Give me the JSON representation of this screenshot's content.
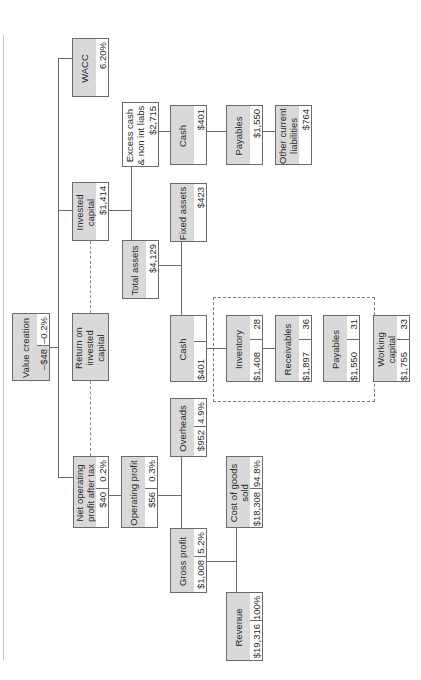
{
  "diagram": {
    "type": "value driver tree",
    "orientation": "rotated 90 degrees counter-clockwise",
    "colors": {
      "box_fill": "#d9d9d9",
      "box_border": "#6b6b6b",
      "line": "#6a6a6a",
      "value_cell": "#ffffff"
    },
    "nodes": {
      "value_creation": {
        "label": "Value creation",
        "value": "–$48",
        "pct": "–0.2%"
      },
      "wacc": {
        "label": "WACC",
        "value": "6.20%"
      },
      "invested_capital": {
        "label": "Invested capital",
        "value": "$1,414"
      },
      "roic": {
        "label": "Return on invested capital",
        "value": "2.8%"
      },
      "nopat": {
        "label": "Net operating profit after tax",
        "value": "$40",
        "pct": "0.2%"
      },
      "excess_cash": {
        "label": "Excess cash & non int liabs",
        "value": "$2,715"
      },
      "total_assets": {
        "label": "Total assets",
        "value": "$4,129"
      },
      "operating_profit": {
        "label": "Operating profit",
        "value": "$56",
        "pct": "0.3%"
      },
      "cash_top": {
        "label": "Cash",
        "value": "$401"
      },
      "fixed_assets": {
        "label": "Fixed assets",
        "value": "$423"
      },
      "cash_mid": {
        "label": "Cash",
        "value": "$401"
      },
      "overheads": {
        "label": "Overheads",
        "value": "$952",
        "pct": "4.9%"
      },
      "gross_profit": {
        "label": "Gross profit",
        "value": "$1,008",
        "pct": "5.2%"
      },
      "payables_top": {
        "label": "Payables",
        "value": "$1,550"
      },
      "other_current_liabilities": {
        "label": "Other current liabilities",
        "value": "$764"
      },
      "inventory": {
        "label": "Inventory",
        "value": "$1,408",
        "days": "28"
      },
      "receivables": {
        "label": "Receivables",
        "value": "$1,897",
        "days": "36"
      },
      "payables_mid": {
        "label": "Payables",
        "value": "$1,550",
        "days": "31"
      },
      "working_capital": {
        "label": "Working capital",
        "value": "$1,755",
        "days": "33"
      },
      "cogs": {
        "label": "Cost of goods sold",
        "value": "$18,308",
        "pct": "94.8%"
      },
      "revenue": {
        "label": "Revenue",
        "value": "$19,316",
        "pct": "100%"
      }
    }
  }
}
